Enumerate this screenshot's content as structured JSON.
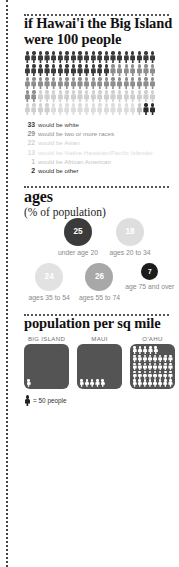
{
  "section_people": {
    "title": "if Hawai'i the Big Island were 100 people",
    "total": 100,
    "legend": [
      {
        "value": "33",
        "label": "would be white",
        "color": "#3b3b3b"
      },
      {
        "value": "29",
        "label": "would be two or more races",
        "color": "#8e8e8e"
      },
      {
        "value": "22",
        "label": "would be Asian",
        "color": "#cfcfcf"
      },
      {
        "value": "13",
        "label": "would be Native Hawaiian/Pacific Islander",
        "color": "#dcdcdc"
      },
      {
        "value": "1",
        "label": "would be African American",
        "color": "#c4c4c4"
      },
      {
        "value": "2",
        "label": "would be other",
        "color": "#2b2b2b"
      }
    ]
  },
  "section_ages": {
    "title": "ages",
    "subtitle": "(% of population)",
    "groups": [
      {
        "value": "25",
        "label": "under age 20",
        "color": "#3b3b3b",
        "size": "lg"
      },
      {
        "value": "18",
        "label": "ages 20 to 34",
        "color": "#dedede",
        "size": "lg"
      },
      {
        "value": "24",
        "label": "ages 35 to 54",
        "color": "#e2e2e2",
        "size": "lg"
      },
      {
        "value": "26",
        "label": "ages 55 to 74",
        "color": "#a8a8a8",
        "size": "lg"
      },
      {
        "value": "7",
        "label": "age 75 and over",
        "color": "#1c1c1c",
        "size": "sm"
      }
    ]
  },
  "section_density": {
    "title": "population per sq mile",
    "key_label": "= 50 people",
    "key_unit": 50,
    "islands": [
      {
        "name": "BIG ISLAND",
        "figures": 1
      },
      {
        "name": "MAUI",
        "figures": 5
      },
      {
        "name": "O'AHU",
        "figures": 37
      }
    ]
  },
  "chart_data": {
    "type": "pictogram",
    "title": "if Hawai'i the Big Island were 100 people",
    "charts": [
      {
        "type": "pictogram",
        "title": "if Hawai'i the Big Island were 100 people",
        "unit": "1 figure = 1 person",
        "total": 100,
        "categories": [
          "white",
          "two or more races",
          "Asian",
          "Native Hawaiian/Pacific Islander",
          "African American",
          "other"
        ],
        "values": [
          33,
          29,
          22,
          13,
          1,
          2
        ],
        "colors": [
          "#3b3b3b",
          "#8e8e8e",
          "#cfcfcf",
          "#dcdcdc",
          "#c4c4c4",
          "#2b2b2b"
        ]
      },
      {
        "type": "bubble",
        "title": "ages",
        "subtitle": "(% of population)",
        "categories": [
          "under age 20",
          "ages 20 to 34",
          "ages 35 to 54",
          "ages 55 to 74",
          "age 75 and over"
        ],
        "values": [
          25,
          18,
          24,
          26,
          7
        ],
        "ylabel": "% of population"
      },
      {
        "type": "pictogram",
        "title": "population per sq mile",
        "unit": "1 figure = 50 people",
        "categories": [
          "BIG ISLAND",
          "MAUI",
          "O'AHU"
        ],
        "values": [
          50,
          250,
          1850
        ]
      }
    ]
  }
}
